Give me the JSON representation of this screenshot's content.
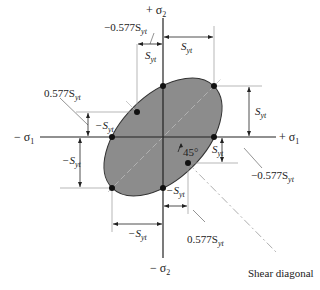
{
  "axes": {
    "pos_sigma1": "+ σ",
    "neg_sigma1": "− σ",
    "pos_sigma2": "+ σ",
    "neg_sigma2": "− σ",
    "sub1": "1",
    "sub2": "2"
  },
  "labels": {
    "S": "S",
    "sub_yt": "yt",
    "neg_S": "−S",
    "coef_pos": "0.577S",
    "coef_neg": "−0.577S",
    "angle": "45°",
    "shear_diagonal": "Shear diagonal"
  },
  "colors": {
    "ellipse_fill": "#8c8c8c",
    "line": "#222222",
    "dashed": "#aaaaaa"
  }
}
